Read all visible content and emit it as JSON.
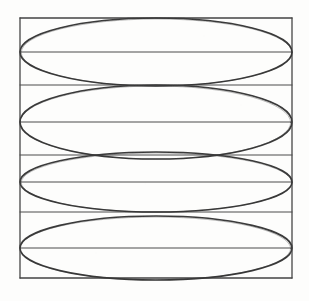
{
  "figure": {
    "medium": "hand-drawn pencil on paper",
    "background_color": "#fdfdfc",
    "ink_color": "#3a3a3a",
    "grid_line_color": "#4a4a4a",
    "canvas": {
      "width": 309,
      "height": 301
    }
  },
  "square": {
    "name": "bounding-square",
    "left": 20,
    "top": 18,
    "right": 292,
    "bottom": 278,
    "width": 272,
    "height": 260,
    "stroke_width": 1.3
  },
  "vertical_lines": [
    {
      "label": "center-vertical-axis",
      "x": 155,
      "y1": 18,
      "y2": 278,
      "stroke_width": 1.2
    }
  ],
  "horizontal_lines": [
    {
      "label": "top-border",
      "y": 18,
      "stroke_width": 1.3
    },
    {
      "label": "ellipse-1-major-axis",
      "y": 52,
      "stroke_width": 1.0
    },
    {
      "label": "band-1-2-divider",
      "y": 85,
      "stroke_width": 1.0
    },
    {
      "label": "ellipse-2-major-axis",
      "y": 122,
      "stroke_width": 1.0
    },
    {
      "label": "band-2-3-divider",
      "y": 155,
      "stroke_width": 1.0
    },
    {
      "label": "ellipse-3-major-axis",
      "y": 182,
      "stroke_width": 1.0
    },
    {
      "label": "band-3-4-divider",
      "y": 212,
      "stroke_width": 1.0
    },
    {
      "label": "ellipse-4-major-axis",
      "y": 248,
      "stroke_width": 1.0
    },
    {
      "label": "bottom-border",
      "y": 278,
      "stroke_width": 1.3
    }
  ],
  "ellipses": [
    {
      "label": "ellipse-1",
      "cx": 156,
      "cy": 52,
      "rx": 136,
      "ry": 34,
      "stroke_width": 1.6
    },
    {
      "label": "ellipse-2",
      "cx": 156,
      "cy": 122,
      "rx": 136,
      "ry": 37,
      "stroke_width": 1.6
    },
    {
      "label": "ellipse-3",
      "cx": 156,
      "cy": 182,
      "rx": 136,
      "ry": 30,
      "stroke_width": 1.6
    },
    {
      "label": "ellipse-4",
      "cx": 156,
      "cy": 248,
      "rx": 136,
      "ry": 32,
      "stroke_width": 1.6
    }
  ],
  "chart_data": {
    "type": "scatter",
    "xlabel": "",
    "ylabel": "",
    "xlim": [
      20,
      292
    ],
    "ylim": [
      18,
      278
    ],
    "grid": true,
    "legend": "none",
    "annotations": [],
    "series": [
      {
        "name": "ellipse-1",
        "cx": 156,
        "cy": 52,
        "rx": 136,
        "ry": 34
      },
      {
        "name": "ellipse-2",
        "cx": 156,
        "cy": 122,
        "rx": 136,
        "ry": 37
      },
      {
        "name": "ellipse-3",
        "cx": 156,
        "cy": 182,
        "rx": 136,
        "ry": 30
      },
      {
        "name": "ellipse-4",
        "cx": 156,
        "cy": 248,
        "rx": 136,
        "ry": 32
      }
    ],
    "gridlines_y": [
      18,
      52,
      85,
      122,
      155,
      182,
      212,
      248,
      278
    ],
    "gridlines_x": [
      20,
      155,
      292
    ]
  }
}
